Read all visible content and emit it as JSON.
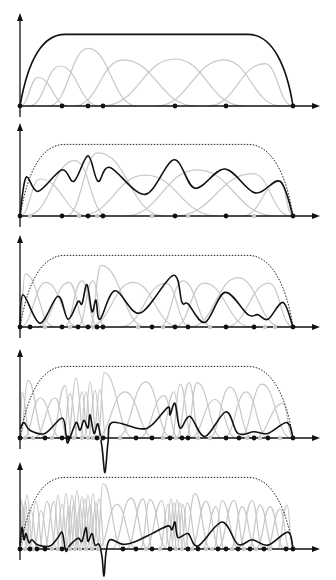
{
  "figure": {
    "colors": {
      "axis": "#111111",
      "basis": "#c8c8c8",
      "combination": "#111111",
      "envelope": "#222222"
    },
    "x_origin": 20,
    "x_end": 293,
    "arrow_tip": 320,
    "panels": [
      {
        "id": "panel-1",
        "baseline": 106,
        "top": 14,
        "height": 77,
        "envelope_style": "solid",
        "knots": [
          20,
          62,
          88,
          103,
          175,
          226,
          293
        ],
        "faint_knots": [],
        "basis_peaks": [
          [
            38,
            0.37
          ],
          [
            60,
            0.52
          ],
          [
            88,
            0.75
          ],
          [
            123,
            0.6
          ],
          [
            175,
            0.61
          ],
          [
            224,
            0.6
          ],
          [
            265,
            0.55
          ]
        ],
        "combination": []
      },
      {
        "id": "panel-2",
        "baseline": 216,
        "top": 124,
        "height": 77,
        "envelope_style": "dotted",
        "knots": [
          20,
          62,
          88,
          103,
          175,
          226,
          293
        ],
        "faint_knots": [
          30,
          79,
          97,
          152,
          188,
          254
        ],
        "basis_peaks": [
          [
            40,
            0.48
          ],
          [
            75,
            0.72
          ],
          [
            98,
            0.82
          ],
          [
            145,
            0.53
          ],
          [
            197,
            0.6
          ],
          [
            253,
            0.55
          ],
          [
            280,
            0.45
          ]
        ],
        "combination": [
          [
            20,
            0
          ],
          [
            26,
            0.5
          ],
          [
            38,
            0.32
          ],
          [
            62,
            0.6
          ],
          [
            74,
            0.45
          ],
          [
            88,
            0.78
          ],
          [
            98,
            0.45
          ],
          [
            110,
            0.63
          ],
          [
            145,
            0.28
          ],
          [
            174,
            0.73
          ],
          [
            195,
            0.36
          ],
          [
            225,
            0.61
          ],
          [
            255,
            0.3
          ],
          [
            280,
            0.45
          ],
          [
            293,
            0
          ]
        ]
      },
      {
        "id": "panel-3",
        "baseline": 327,
        "top": 236,
        "height": 77,
        "envelope_style": "dotted",
        "knots": [
          20,
          30,
          62,
          78,
          88,
          97,
          103,
          152,
          175,
          188,
          226,
          254,
          293
        ],
        "faint_knots": [
          45,
          70,
          93,
          138,
          163,
          210,
          265,
          275
        ],
        "basis_peaks": [
          [
            25,
            0.69
          ],
          [
            46,
            0.58
          ],
          [
            69,
            0.58
          ],
          [
            82,
            0.6
          ],
          [
            93,
            0.6
          ],
          [
            101,
            0.8
          ],
          [
            133,
            0.58
          ],
          [
            166,
            0.57
          ],
          [
            183,
            0.6
          ],
          [
            204,
            0.57
          ],
          [
            238,
            0.64
          ],
          [
            269,
            0.57
          ]
        ],
        "combination": [
          [
            20,
            0
          ],
          [
            23,
            0.42
          ],
          [
            40,
            0.05
          ],
          [
            58,
            0.4
          ],
          [
            68,
            0.1
          ],
          [
            78,
            0.33
          ],
          [
            82,
            0.3
          ],
          [
            87,
            0.55
          ],
          [
            92,
            0.2
          ],
          [
            96,
            0.35
          ],
          [
            100,
            0.1
          ],
          [
            115,
            0.47
          ],
          [
            140,
            0.18
          ],
          [
            173,
            0.67
          ],
          [
            182,
            0.32
          ],
          [
            188,
            0.3
          ],
          [
            205,
            0.06
          ],
          [
            225,
            0.45
          ],
          [
            248,
            0.16
          ],
          [
            258,
            0.16
          ],
          [
            268,
            0.1
          ],
          [
            283,
            0.32
          ],
          [
            293,
            0
          ]
        ]
      },
      {
        "id": "panel-4",
        "baseline": 438,
        "top": 350,
        "height": 77,
        "envelope_style": "dotted",
        "knots": [
          20,
          45,
          62,
          68,
          97,
          103,
          136,
          152,
          170,
          182,
          188,
          226,
          239,
          254,
          268,
          293
        ],
        "faint_knots": [
          25,
          33,
          52,
          74,
          82,
          88,
          93,
          100,
          120,
          163,
          176,
          198,
          210,
          247,
          260,
          280
        ],
        "basis_peaks": [
          [
            22,
            0.6
          ],
          [
            28,
            0.75
          ],
          [
            40,
            0.52
          ],
          [
            55,
            0.52
          ],
          [
            65,
            0.68
          ],
          [
            70,
            0.58
          ],
          [
            76,
            0.78
          ],
          [
            82,
            0.6
          ],
          [
            86,
            0.6
          ],
          [
            90,
            0.73
          ],
          [
            95,
            0.62
          ],
          [
            100,
            0.63
          ],
          [
            104,
            0.85
          ],
          [
            125,
            0.6
          ],
          [
            146,
            0.73
          ],
          [
            164,
            0.55
          ],
          [
            174,
            0.6
          ],
          [
            180,
            0.7
          ],
          [
            189,
            0.72
          ],
          [
            197,
            0.72
          ],
          [
            215,
            0.5
          ],
          [
            230,
            0.66
          ],
          [
            246,
            0.6
          ],
          [
            262,
            0.7
          ],
          [
            283,
            0.45
          ]
        ],
        "combination": [
          [
            20,
            0.12
          ],
          [
            24,
            0.2
          ],
          [
            30,
            0.1
          ],
          [
            45,
            0.06
          ],
          [
            62,
            0.26
          ],
          [
            66,
            0.05
          ],
          [
            68,
            -0.06
          ],
          [
            76,
            0.2
          ],
          [
            80,
            0.1
          ],
          [
            84,
            0.23
          ],
          [
            88,
            0.13
          ],
          [
            90,
            0.3
          ],
          [
            94,
            0.06
          ],
          [
            98,
            0.18
          ],
          [
            102,
            -0.12
          ],
          [
            105,
            -0.45
          ],
          [
            108,
            -0.06
          ],
          [
            112,
            0.2
          ],
          [
            140,
            0.12
          ],
          [
            152,
            0.17
          ],
          [
            168,
            0.4
          ],
          [
            170,
            0.3
          ],
          [
            175,
            0.45
          ],
          [
            180,
            0.13
          ],
          [
            190,
            0.28
          ],
          [
            205,
            0.02
          ],
          [
            226,
            0.34
          ],
          [
            238,
            0.06
          ],
          [
            254,
            0.08
          ],
          [
            268,
            0.06
          ],
          [
            287,
            0.2
          ],
          [
            293,
            0
          ]
        ]
      },
      {
        "id": "panel-5",
        "baseline": 549,
        "top": 463,
        "height": 77,
        "envelope_style": "dotted",
        "knots": [
          20,
          30,
          37,
          45,
          62,
          123,
          136,
          152,
          170,
          188,
          198,
          218,
          226,
          238,
          250,
          264,
          286,
          293
        ],
        "faint_knots": [
          25,
          33,
          52,
          58,
          70,
          75,
          80,
          86,
          92,
          98,
          146,
          160,
          176,
          182,
          192,
          206,
          212,
          232,
          244,
          256,
          270
        ],
        "basis_peaks": [
          [
            21,
            0.64
          ],
          [
            23,
            0.55
          ],
          [
            25,
            0.62
          ],
          [
            27,
            0.7
          ],
          [
            31,
            0.5
          ],
          [
            36,
            0.62
          ],
          [
            41,
            0.5
          ],
          [
            47,
            0.62
          ],
          [
            54,
            0.62
          ],
          [
            58,
            0.7
          ],
          [
            62,
            0.58
          ],
          [
            66,
            0.72
          ],
          [
            69,
            0.55
          ],
          [
            72,
            0.7
          ],
          [
            74,
            0.6
          ],
          [
            77,
            0.76
          ],
          [
            80,
            0.55
          ],
          [
            82,
            0.68
          ],
          [
            85,
            0.65
          ],
          [
            88,
            0.7
          ],
          [
            90,
            0.58
          ],
          [
            93,
            0.72
          ],
          [
            96,
            0.6
          ],
          [
            99,
            0.65
          ],
          [
            103,
            0.85
          ],
          [
            117,
            0.58
          ],
          [
            131,
            0.66
          ],
          [
            143,
            0.65
          ],
          [
            150,
            0.64
          ],
          [
            162,
            0.63
          ],
          [
            168,
            0.58
          ],
          [
            171,
            0.65
          ],
          [
            174,
            0.6
          ],
          [
            177,
            0.64
          ],
          [
            180,
            0.6
          ],
          [
            183,
            0.58
          ],
          [
            187,
            0.6
          ],
          [
            195,
            0.72
          ],
          [
            206,
            0.62
          ],
          [
            216,
            0.55
          ],
          [
            222,
            0.63
          ],
          [
            234,
            0.63
          ],
          [
            242,
            0.55
          ],
          [
            252,
            0.63
          ],
          [
            260,
            0.57
          ],
          [
            270,
            0.55
          ],
          [
            280,
            0.52
          ],
          [
            287,
            0.57
          ]
        ],
        "combination": [
          [
            20,
            0.05
          ],
          [
            22,
            0.28
          ],
          [
            24,
            0.12
          ],
          [
            26,
            0.2
          ],
          [
            29,
            0.08
          ],
          [
            32,
            0.12
          ],
          [
            38,
            0.05
          ],
          [
            50,
            0.04
          ],
          [
            58,
            0.15
          ],
          [
            62,
            0.22
          ],
          [
            64,
            0.1
          ],
          [
            66,
            -0.03
          ],
          [
            70,
            0.05
          ],
          [
            78,
            0.14
          ],
          [
            82,
            0.1
          ],
          [
            86,
            0.28
          ],
          [
            88,
            0.1
          ],
          [
            92,
            0.2
          ],
          [
            95,
            0.05
          ],
          [
            99,
            0.06
          ],
          [
            102,
            -0.1
          ],
          [
            104,
            -0.35
          ],
          [
            106,
            -0.05
          ],
          [
            110,
            0.12
          ],
          [
            123,
            0.06
          ],
          [
            136,
            0.1
          ],
          [
            152,
            0.2
          ],
          [
            168,
            0.3
          ],
          [
            172,
            0.25
          ],
          [
            175,
            0.35
          ],
          [
            178,
            0.15
          ],
          [
            188,
            0.2
          ],
          [
            198,
            0.04
          ],
          [
            222,
            0.35
          ],
          [
            238,
            0.06
          ],
          [
            252,
            0.12
          ],
          [
            268,
            0.05
          ],
          [
            288,
            0.22
          ],
          [
            293,
            0
          ]
        ]
      }
    ]
  }
}
